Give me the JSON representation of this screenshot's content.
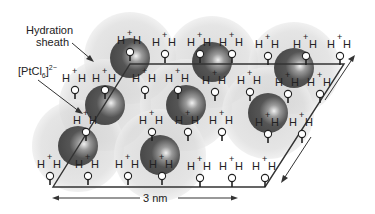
{
  "labels": {
    "hydration_sheath_line1": "Hydration",
    "hydration_sheath_line2": "sheath",
    "anion_base": "[PtCl",
    "anion_sub": "6",
    "anion_close": "]",
    "anion_charge": "2−",
    "scale": "3 nm"
  },
  "colors": {
    "sphere": "#555555",
    "sheath": "#d4d4d4",
    "line": "#333333",
    "text": "#222222"
  },
  "lattice": {
    "corners": [
      [
        53,
        187
      ],
      [
        265,
        187
      ],
      [
        344,
        64
      ],
      [
        130,
        64
      ]
    ]
  },
  "anions": [
    {
      "cx": 130,
      "cy": 58
    },
    {
      "cx": 212,
      "cy": 62
    },
    {
      "cx": 294,
      "cy": 68
    },
    {
      "cx": 105,
      "cy": 105
    },
    {
      "cx": 186,
      "cy": 105
    },
    {
      "cx": 268,
      "cy": 113
    },
    {
      "cx": 78,
      "cy": 146
    },
    {
      "cx": 160,
      "cy": 155
    }
  ],
  "hydronium": [
    {
      "x": 130,
      "y": 44
    },
    {
      "x": 165,
      "y": 46
    },
    {
      "x": 200,
      "y": 46
    },
    {
      "x": 232,
      "y": 46
    },
    {
      "x": 268,
      "y": 48
    },
    {
      "x": 306,
      "y": 48
    },
    {
      "x": 340,
      "y": 48
    },
    {
      "x": 75,
      "y": 82
    },
    {
      "x": 105,
      "y": 82
    },
    {
      "x": 145,
      "y": 82
    },
    {
      "x": 178,
      "y": 82
    },
    {
      "x": 215,
      "y": 84
    },
    {
      "x": 250,
      "y": 84
    },
    {
      "x": 288,
      "y": 86
    },
    {
      "x": 320,
      "y": 86
    },
    {
      "x": 86,
      "y": 124
    },
    {
      "x": 152,
      "y": 124
    },
    {
      "x": 188,
      "y": 124
    },
    {
      "x": 222,
      "y": 124
    },
    {
      "x": 268,
      "y": 126
    },
    {
      "x": 302,
      "y": 126
    },
    {
      "x": 50,
      "y": 168
    },
    {
      "x": 88,
      "y": 168
    },
    {
      "x": 128,
      "y": 168
    },
    {
      "x": 162,
      "y": 168
    },
    {
      "x": 200,
      "y": 170
    },
    {
      "x": 232,
      "y": 170
    },
    {
      "x": 265,
      "y": 170
    }
  ]
}
